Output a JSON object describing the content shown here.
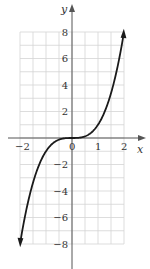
{
  "chart_data": {
    "type": "line",
    "title": "",
    "function": "y = x^3",
    "xlabel": "x",
    "ylabel": "y",
    "xlim": [
      -2.0,
      2.0
    ],
    "ylim": [
      -8,
      8
    ],
    "grid": true,
    "x_grid_step": 0.5,
    "y_grid_step": 1,
    "x_tick_labels": [
      "-2",
      "0",
      "1",
      "2"
    ],
    "y_tick_labels": [
      "8",
      "6",
      "4",
      "2",
      "-2",
      "-4",
      "-6",
      "-8"
    ],
    "series": [
      {
        "name": "y = x^3",
        "x": [
          -2.0,
          -1.5,
          -1.0,
          -0.5,
          0,
          0.5,
          1.0,
          1.5,
          2.0
        ],
        "y": [
          -8,
          -3.375,
          -1,
          -0.125,
          0,
          0.125,
          1,
          3.375,
          8
        ],
        "arrows_at_ends": true
      }
    ]
  },
  "labels": {
    "x_axis": "x",
    "y_axis": "y",
    "x_ticks": [
      {
        "v": -2,
        "t": "−2"
      },
      {
        "v": 0,
        "t": "0"
      },
      {
        "v": 1,
        "t": "1"
      },
      {
        "v": 2,
        "t": "2"
      }
    ],
    "y_ticks": [
      {
        "v": 8,
        "t": "8"
      },
      {
        "v": 6,
        "t": "6"
      },
      {
        "v": 4,
        "t": "4"
      },
      {
        "v": 2,
        "t": "2"
      },
      {
        "v": -2,
        "t": "−2"
      },
      {
        "v": -4,
        "t": "−4"
      },
      {
        "v": -6,
        "t": "−6"
      },
      {
        "v": -8,
        "t": "−8"
      }
    ]
  }
}
